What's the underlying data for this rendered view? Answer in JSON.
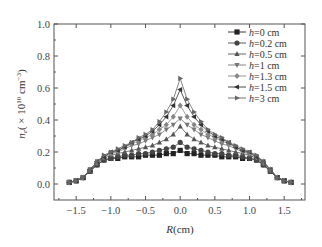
{
  "chart_data": {
    "type": "line",
    "title": "",
    "xlabel": "R(cm)",
    "ylabel": "n_e(×10^10 cm^-3)",
    "ylabel_parts": {
      "main": "n",
      "sub": "e",
      "rest": "( × 10",
      "sup1": "10",
      "unit": " cm",
      "sup2": "−3",
      "close": ")"
    },
    "xlim": [
      -1.82,
      1.8
    ],
    "ylim": [
      -0.1,
      1.0
    ],
    "xticks": [
      -1.5,
      -1.0,
      -0.5,
      0.0,
      0.5,
      1.0,
      1.5
    ],
    "xtick_labels": [
      "−1.5",
      "−1.0",
      "−0.5",
      "0.0",
      "0.5",
      "1.0",
      "1.5"
    ],
    "yticks": [
      0.0,
      0.2,
      0.4,
      0.6,
      0.8,
      1.0
    ],
    "ytick_labels": [
      "0.0",
      "0.2",
      "0.4",
      "0.6",
      "0.8",
      "1.0"
    ],
    "grid": false,
    "legend_position": "upper right",
    "x": [
      -1.6,
      -1.5,
      -1.4,
      -1.3,
      -1.2,
      -1.1,
      -1.0,
      -0.9,
      -0.8,
      -0.7,
      -0.6,
      -0.5,
      -0.4,
      -0.3,
      -0.2,
      -0.1,
      0.0,
      0.1,
      0.2,
      0.3,
      0.4,
      0.5,
      0.6,
      0.7,
      0.8,
      0.9,
      1.0,
      1.1,
      1.2,
      1.3,
      1.4,
      1.5,
      1.6
    ],
    "series": [
      {
        "name": "h=0 cm",
        "marker": "square",
        "values": [
          0.01,
          0.02,
          0.04,
          0.08,
          0.12,
          0.15,
          0.16,
          0.16,
          0.17,
          0.17,
          0.17,
          0.18,
          0.18,
          0.18,
          0.19,
          0.19,
          0.21,
          0.19,
          0.19,
          0.18,
          0.18,
          0.18,
          0.17,
          0.17,
          0.17,
          0.16,
          0.16,
          0.15,
          0.12,
          0.08,
          0.04,
          0.02,
          0.01
        ]
      },
      {
        "name": "h=0.2 cm",
        "marker": "circle",
        "values": [
          0.01,
          0.02,
          0.04,
          0.08,
          0.12,
          0.15,
          0.16,
          0.17,
          0.18,
          0.18,
          0.19,
          0.19,
          0.2,
          0.21,
          0.22,
          0.23,
          0.26,
          0.23,
          0.22,
          0.21,
          0.2,
          0.19,
          0.19,
          0.18,
          0.18,
          0.17,
          0.16,
          0.15,
          0.12,
          0.08,
          0.04,
          0.02,
          0.01
        ]
      },
      {
        "name": "h=0.5 cm",
        "marker": "triangle-up",
        "values": [
          0.01,
          0.02,
          0.04,
          0.08,
          0.13,
          0.16,
          0.18,
          0.19,
          0.2,
          0.21,
          0.22,
          0.23,
          0.24,
          0.26,
          0.28,
          0.31,
          0.36,
          0.31,
          0.28,
          0.26,
          0.24,
          0.23,
          0.22,
          0.21,
          0.2,
          0.19,
          0.18,
          0.16,
          0.13,
          0.08,
          0.04,
          0.02,
          0.01
        ]
      },
      {
        "name": "h=1 cm",
        "marker": "triangle-down",
        "values": [
          0.01,
          0.02,
          0.04,
          0.09,
          0.13,
          0.17,
          0.19,
          0.2,
          0.22,
          0.24,
          0.25,
          0.27,
          0.29,
          0.31,
          0.34,
          0.37,
          0.41,
          0.37,
          0.34,
          0.31,
          0.29,
          0.27,
          0.25,
          0.24,
          0.22,
          0.2,
          0.19,
          0.17,
          0.13,
          0.09,
          0.04,
          0.02,
          0.01
        ]
      },
      {
        "name": "h=1.3 cm",
        "marker": "diamond",
        "values": [
          0.01,
          0.02,
          0.04,
          0.09,
          0.14,
          0.17,
          0.19,
          0.21,
          0.23,
          0.25,
          0.27,
          0.29,
          0.31,
          0.34,
          0.37,
          0.42,
          0.49,
          0.42,
          0.37,
          0.34,
          0.31,
          0.29,
          0.27,
          0.25,
          0.23,
          0.21,
          0.19,
          0.17,
          0.14,
          0.09,
          0.04,
          0.02,
          0.01
        ]
      },
      {
        "name": "h=1.5 cm",
        "marker": "triangle-left",
        "values": [
          0.01,
          0.02,
          0.04,
          0.09,
          0.14,
          0.17,
          0.2,
          0.21,
          0.23,
          0.26,
          0.28,
          0.3,
          0.33,
          0.37,
          0.42,
          0.49,
          0.59,
          0.49,
          0.42,
          0.37,
          0.33,
          0.3,
          0.28,
          0.26,
          0.23,
          0.21,
          0.2,
          0.17,
          0.14,
          0.09,
          0.04,
          0.02,
          0.01
        ]
      },
      {
        "name": "h=3 cm",
        "marker": "triangle-right",
        "values": [
          0.01,
          0.02,
          0.04,
          0.09,
          0.14,
          0.18,
          0.2,
          0.22,
          0.24,
          0.26,
          0.29,
          0.31,
          0.34,
          0.39,
          0.45,
          0.53,
          0.66,
          0.53,
          0.45,
          0.39,
          0.34,
          0.31,
          0.29,
          0.26,
          0.24,
          0.22,
          0.2,
          0.18,
          0.14,
          0.09,
          0.04,
          0.02,
          0.01
        ]
      }
    ]
  },
  "colors": {
    "axis": "#555555",
    "series": [
      "#222222",
      "#444444",
      "#555555",
      "#777777",
      "#888888",
      "#333333",
      "#666666"
    ]
  }
}
